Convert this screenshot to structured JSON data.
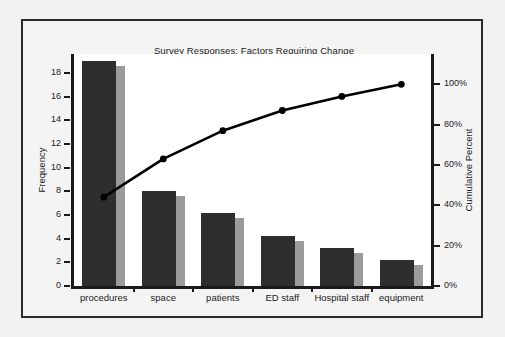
{
  "chart_data": {
    "type": "bar",
    "title": "Survey Responses: Factors Requiring Change",
    "xlabel": "",
    "ylabel": "Frequency",
    "y2label": "Cumulative Percent",
    "categories": [
      "procedures",
      "space",
      "patients",
      "ED staff",
      "Hospital staff",
      "equipment"
    ],
    "values": [
      19,
      8,
      6.2,
      4.2,
      3.2,
      2.2
    ],
    "series": [
      {
        "name": "Frequency",
        "values": [
          19,
          8,
          6.2,
          4.2,
          3.2,
          2.2
        ]
      },
      {
        "name": "Cumulative Percent",
        "values": [
          44,
          63,
          77,
          87,
          94,
          100
        ]
      }
    ],
    "cumulative_percent": [
      44,
      63,
      77,
      87,
      94,
      100
    ],
    "ylim": [
      0,
      19.6
    ],
    "y2lim": [
      0,
      115
    ],
    "yticks": [
      0,
      2,
      4,
      6,
      8,
      10,
      12,
      14,
      16,
      18
    ],
    "ytick_labels": [
      "0",
      "2",
      "4",
      "6",
      "8",
      "10",
      "12",
      "14",
      "16",
      "18"
    ],
    "y2ticks": [
      0,
      20,
      40,
      60,
      80,
      100
    ],
    "y2tick_labels": [
      "0%",
      "20%",
      "40%",
      "60%",
      "80%",
      "100%"
    ],
    "grid": false,
    "legend": "none",
    "colors": {
      "bar_main": "#2e2e2e",
      "bar_side": "#9b9b9b",
      "line": "#000000",
      "marker": "#000000",
      "axis": "#1a1a1a",
      "plot_background": "#ffffff",
      "figure_background": "#f4f4f4",
      "frame_border": "#2b2b2b"
    }
  }
}
